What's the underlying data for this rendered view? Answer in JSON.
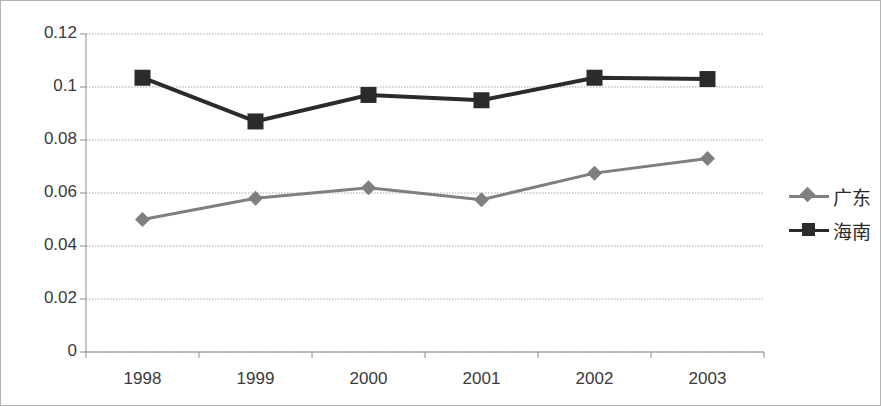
{
  "chart_data": {
    "type": "line",
    "title": "",
    "subtitle": "",
    "xlabel": "",
    "ylabel": "",
    "categories": [
      "1998",
      "1999",
      "2000",
      "2001",
      "2002",
      "2003"
    ],
    "series": [
      {
        "name": "广东",
        "marker": "diamond",
        "color": "#7f7f7f",
        "values": [
          0.05,
          0.058,
          0.062,
          0.0575,
          0.0675,
          0.073
        ]
      },
      {
        "name": "海南",
        "marker": "square",
        "color": "#2b2b2b",
        "values": [
          0.1035,
          0.087,
          0.097,
          0.095,
          0.1035,
          0.103
        ]
      }
    ],
    "ylim": [
      0,
      0.12
    ],
    "yticks": [
      "0",
      "0.02",
      "0.04",
      "0.06",
      "0.08",
      "0.1",
      "0.12"
    ],
    "ytick_values": [
      0,
      0.02,
      0.04,
      0.06,
      0.08,
      0.1,
      0.12
    ],
    "grid": true,
    "grid_axis": "y",
    "grid_color": "#a6a6a6",
    "legend_position": "right",
    "plot_border_color": "#808080",
    "frame_border_color": "#b3b3b3",
    "background": "#ffffff"
  },
  "legend": {
    "items": [
      {
        "label": "广东",
        "marker": "diamond",
        "color": "#7f7f7f"
      },
      {
        "label": "海南",
        "marker": "square",
        "color": "#2b2b2b"
      }
    ]
  },
  "axes": {
    "y_labels": [
      "0.12",
      "0.1",
      "0.08",
      "0.06",
      "0.04",
      "0.02",
      "0"
    ],
    "x_labels": [
      "1998",
      "1999",
      "2000",
      "2001",
      "2002",
      "2003"
    ]
  }
}
